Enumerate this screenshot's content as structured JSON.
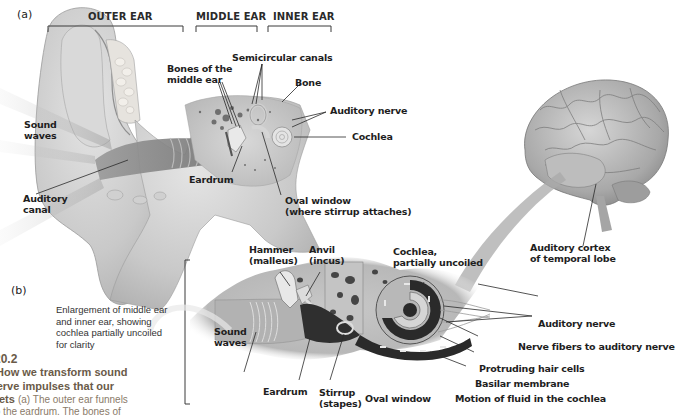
{
  "figure": {
    "number": "20.2",
    "caption_title_lines": [
      "How we transform sound",
      "nerve impulses that our",
      "prets"
    ],
    "caption_body_lines": [
      "(a) The outer ear funnels",
      "to the eardrum. The bones of"
    ]
  },
  "panel_a": {
    "label": "(a)",
    "regions": [
      "OUTER EAR",
      "MIDDLE EAR",
      "INNER EAR"
    ],
    "labels": {
      "sound_waves": [
        "Sound",
        "waves"
      ],
      "auditory_canal": [
        "Auditory",
        "canal"
      ],
      "bones_middle_ear": [
        "Bones of the",
        "middle ear"
      ],
      "semicircular_canals": "Semicircular canals",
      "bone": "Bone",
      "auditory_nerve": "Auditory nerve",
      "cochlea": "Cochlea",
      "eardrum": "Eardrum",
      "oval_window": [
        "Oval window",
        "(where stirrup attaches)"
      ]
    }
  },
  "brain": {
    "labels": {
      "auditory_cortex": [
        "Auditory cortex",
        "of temporal lobe"
      ]
    }
  },
  "panel_b": {
    "label": "(b)",
    "description": [
      "Enlargement of middle ear",
      "and inner ear, showing",
      "cochlea partially uncoiled",
      "for clarity"
    ],
    "labels": {
      "hammer": [
        "Hammer",
        "(malleus)"
      ],
      "anvil": [
        "Anvil",
        "(incus)"
      ],
      "cochlea_uncoiled": [
        "Cochlea,",
        "partially uncoiled"
      ],
      "sound_waves": [
        "Sound",
        "waves"
      ],
      "eardrum": "Eardrum",
      "stirrup": [
        "Stirrup",
        "(stapes)"
      ],
      "oval_window": "Oval window",
      "auditory_nerve": "Auditory nerve",
      "nerve_fibers": "Nerve fibers to auditory nerve",
      "hair_cells": "Protruding hair cells",
      "basilar_membrane": "Basilar membrane",
      "fluid_motion": "Motion of fluid in the cochlea"
    }
  }
}
